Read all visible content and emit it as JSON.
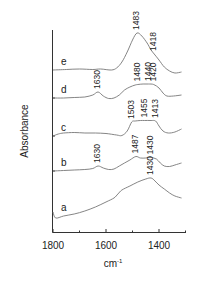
{
  "chart_data": {
    "type": "line",
    "title": "",
    "xlabel": "cm-1",
    "xlabel_main": "cm",
    "xlabel_sup": "-1",
    "ylabel": "Absorbance",
    "xlim": [
      1800,
      1300
    ],
    "x_reversed": true,
    "grid": false,
    "legend_position": "inline-left",
    "x_ticks": [
      {
        "value": 1800,
        "label": "1800"
      },
      {
        "value": 1600,
        "label": "1600"
      },
      {
        "value": 1400,
        "label": "1400"
      }
    ],
    "x_minor_ticks": [
      1700,
      1500,
      1300
    ],
    "series": [
      {
        "name": "e",
        "baseline_offset": 70,
        "points": [
          [
            1800,
            70
          ],
          [
            1750,
            69.5
          ],
          [
            1700,
            69
          ],
          [
            1650,
            69.5
          ],
          [
            1620,
            69
          ],
          [
            1580,
            70
          ],
          [
            1560,
            68
          ],
          [
            1540,
            62
          ],
          [
            1520,
            52
          ],
          [
            1500,
            40
          ],
          [
            1483,
            33
          ],
          [
            1465,
            36
          ],
          [
            1445,
            43
          ],
          [
            1430,
            50
          ],
          [
            1418,
            54
          ],
          [
            1400,
            60
          ],
          [
            1380,
            67
          ],
          [
            1360,
            71
          ],
          [
            1340,
            73
          ],
          [
            1315,
            72
          ]
        ],
        "peaks": [
          {
            "x": 1483,
            "label": "1483"
          },
          {
            "x": 1418,
            "label": "1418"
          }
        ]
      },
      {
        "name": "d",
        "baseline_offset": 98,
        "points": [
          [
            1800,
            98
          ],
          [
            1760,
            98
          ],
          [
            1720,
            97.5
          ],
          [
            1680,
            97
          ],
          [
            1650,
            95
          ],
          [
            1630,
            92
          ],
          [
            1610,
            96
          ],
          [
            1590,
            98.5
          ],
          [
            1570,
            98
          ],
          [
            1550,
            95
          ],
          [
            1530,
            90
          ],
          [
            1510,
            87
          ],
          [
            1490,
            85
          ],
          [
            1480,
            84.5
          ],
          [
            1460,
            84
          ],
          [
            1440,
            84
          ],
          [
            1420,
            84.5
          ],
          [
            1400,
            88
          ],
          [
            1385,
            93
          ],
          [
            1370,
            96
          ],
          [
            1345,
            96
          ],
          [
            1315,
            95
          ]
        ],
        "peaks": [
          {
            "x": 1630,
            "label": "1630"
          },
          {
            "x": 1480,
            "label": "1480"
          },
          {
            "x": 1440,
            "label": "1440"
          },
          {
            "x": 1420,
            "label": "1420"
          }
        ]
      },
      {
        "name": "c",
        "baseline_offset": 136,
        "points": [
          [
            1800,
            136
          ],
          [
            1780,
            134
          ],
          [
            1760,
            133
          ],
          [
            1720,
            132.5
          ],
          [
            1680,
            133
          ],
          [
            1640,
            133
          ],
          [
            1600,
            133.5
          ],
          [
            1560,
            135
          ],
          [
            1540,
            135.5
          ],
          [
            1520,
            131
          ],
          [
            1503,
            122
          ],
          [
            1490,
            121
          ],
          [
            1470,
            120.5
          ],
          [
            1455,
            120.5
          ],
          [
            1430,
            120.5
          ],
          [
            1413,
            121
          ],
          [
            1400,
            126
          ],
          [
            1385,
            131
          ],
          [
            1365,
            133
          ],
          [
            1340,
            132
          ],
          [
            1315,
            129
          ]
        ],
        "peaks": [
          {
            "x": 1503,
            "label": "1503"
          },
          {
            "x": 1455,
            "label": "1455"
          },
          {
            "x": 1413,
            "label": "1413"
          }
        ]
      },
      {
        "name": "b",
        "baseline_offset": 171,
        "points": [
          [
            1800,
            171
          ],
          [
            1760,
            170.5
          ],
          [
            1720,
            170
          ],
          [
            1680,
            169.5
          ],
          [
            1650,
            168.5
          ],
          [
            1630,
            166
          ],
          [
            1610,
            168
          ],
          [
            1590,
            169.5
          ],
          [
            1570,
            169
          ],
          [
            1550,
            166
          ],
          [
            1530,
            163
          ],
          [
            1510,
            160
          ],
          [
            1487,
            156.5
          ],
          [
            1470,
            158
          ],
          [
            1450,
            158
          ],
          [
            1430,
            157.5
          ],
          [
            1410,
            159
          ],
          [
            1395,
            163
          ],
          [
            1380,
            166
          ],
          [
            1360,
            166.5
          ],
          [
            1340,
            165
          ],
          [
            1315,
            163
          ]
        ],
        "peaks": [
          {
            "x": 1630,
            "label": "1630"
          },
          {
            "x": 1487,
            "label": "1487"
          },
          {
            "x": 1430,
            "label": "1430"
          }
        ]
      },
      {
        "name": "a",
        "baseline_offset": 216,
        "points": [
          [
            1800,
            212
          ],
          [
            1790,
            218
          ],
          [
            1760,
            216
          ],
          [
            1720,
            214
          ],
          [
            1680,
            211
          ],
          [
            1640,
            207
          ],
          [
            1600,
            202
          ],
          [
            1570,
            198
          ],
          [
            1555,
            194
          ],
          [
            1540,
            190
          ],
          [
            1510,
            186
          ],
          [
            1480,
            182
          ],
          [
            1450,
            179
          ],
          [
            1430,
            178
          ],
          [
            1415,
            181
          ],
          [
            1400,
            185
          ],
          [
            1380,
            189
          ],
          [
            1360,
            193
          ],
          [
            1340,
            196
          ],
          [
            1315,
            198
          ]
        ],
        "peaks": [
          {
            "x": 1430,
            "label": "1430"
          }
        ]
      }
    ]
  }
}
